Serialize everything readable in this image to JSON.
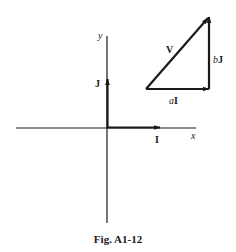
{
  "figure": {
    "caption": "Fig. A1-12",
    "axes": {
      "x_label": "x",
      "y_label": "y",
      "unit_x_label": "I",
      "unit_y_label": "J"
    },
    "triangle": {
      "hypotenuse_label": "V",
      "horizontal_label_coef": "a",
      "horizontal_label_vec": "I",
      "vertical_label_coef": "b",
      "vertical_label_vec": "J"
    },
    "colors": {
      "ink": "#1a1a1a",
      "background": "#ffffff"
    }
  }
}
